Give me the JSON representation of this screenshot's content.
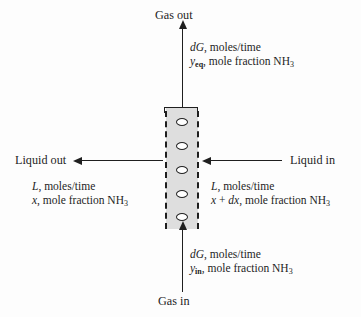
{
  "streams": {
    "gas_out": {
      "label": "Gas out",
      "flow": "dG, moles/time",
      "flow_symbol": "dG",
      "flow_units": "moles/time",
      "composition_symbol": "y",
      "composition_subscript": "eq",
      "composition_rest": ", mole fraction NH",
      "composition_species_sub": "3",
      "direction": "up"
    },
    "gas_in": {
      "label": "Gas in",
      "flow": "dG, moles/time",
      "flow_symbol": "dG",
      "flow_units": "moles/time",
      "composition_symbol": "y",
      "composition_subscript": "in",
      "composition_rest": ", mole fraction NH",
      "composition_species_sub": "3",
      "direction": "up"
    },
    "liquid_out": {
      "label": "Liquid out",
      "flow_symbol": "L",
      "flow_units": ", moles/time",
      "composition_symbol": "x",
      "composition_rest": ", mole fraction NH",
      "composition_species_sub": "3",
      "direction": "left"
    },
    "liquid_in": {
      "label": "Liquid in",
      "flow_symbol": "L",
      "flow_units": ", moles/time",
      "composition_symbol": "x",
      "composition_operator": " + ",
      "composition_differential": "dx",
      "composition_rest": ", mole fraction NH",
      "composition_species_sub": "3",
      "direction": "left"
    }
  },
  "column": {
    "name": "packed absorption column section",
    "packing_count": 5,
    "fill_color": "#dedede",
    "wall_color": "#1f1f1f",
    "wall_style": "dashed"
  }
}
